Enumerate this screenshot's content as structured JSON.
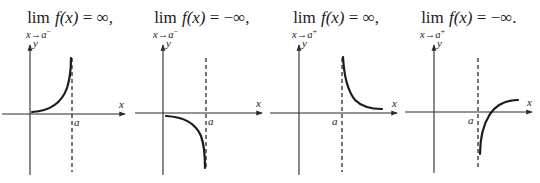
{
  "panels": [
    {
      "lim_word": "lim",
      "subscript_base": "x→a",
      "subscript_side": "−",
      "function": "f(x)",
      "equals": "=",
      "result": "∞,",
      "axis_x_label": "x",
      "axis_y_label": "y",
      "asymptote_label": "a"
    },
    {
      "lim_word": "lim",
      "subscript_base": "x→a",
      "subscript_side": "−",
      "function": "f(x)",
      "equals": "=",
      "result": "−∞,",
      "axis_x_label": "x",
      "axis_y_label": "y",
      "asymptote_label": "a"
    },
    {
      "lim_word": "lim",
      "subscript_base": "x→a",
      "subscript_side": "+",
      "function": "f(x)",
      "equals": "=",
      "result": "∞,",
      "axis_x_label": "x",
      "axis_y_label": "y",
      "asymptote_label": "a"
    },
    {
      "lim_word": "lim",
      "subscript_base": "x→a",
      "subscript_side": "+",
      "function": "f(x)",
      "equals": "=",
      "result": "−∞.",
      "axis_x_label": "x",
      "axis_y_label": "y",
      "asymptote_label": "a"
    }
  ],
  "colors": {
    "ink": "#1a1a1a",
    "axis": "#2b2b2b",
    "background": "#ffffff"
  }
}
